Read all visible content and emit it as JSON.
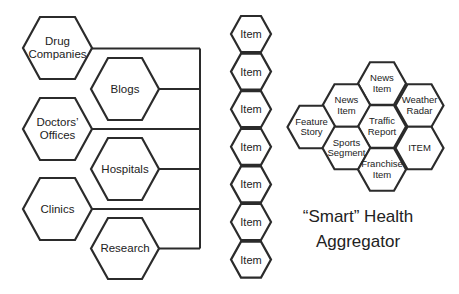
{
  "diagram": {
    "title": {
      "line1": "“Smart” Health",
      "line2": "Aggregator"
    },
    "sources": [
      {
        "label": "Drug Companies",
        "line1": "Drug",
        "line2": "Companies"
      },
      {
        "label": "Blogs",
        "line1": "Blogs",
        "line2": ""
      },
      {
        "label": "Doctors’ Offices",
        "line1": "Doctors’",
        "line2": "Offices"
      },
      {
        "label": "Hospitals",
        "line1": "Hospitals",
        "line2": ""
      },
      {
        "label": "Clinics",
        "line1": "Clinics",
        "line2": ""
      },
      {
        "label": "Research",
        "line1": "Research",
        "line2": ""
      }
    ],
    "items": [
      "Item",
      "Item",
      "Item",
      "Item",
      "Item",
      "Item",
      "Item"
    ],
    "aggregator_cells": [
      {
        "line1": "News",
        "line2": "Item"
      },
      {
        "line1": "News",
        "line2": "Item"
      },
      {
        "line1": "Weather",
        "line2": "Radar"
      },
      {
        "line1": "Feature",
        "line2": "Story"
      },
      {
        "line1": "Traffic",
        "line2": "Report"
      },
      {
        "line1": "Sports",
        "line2": "Segment"
      },
      {
        "line1": "ITEM",
        "line2": ""
      },
      {
        "line1": "Franchise",
        "line2": "Item"
      }
    ],
    "colors": {
      "stroke": "#2b2b2b",
      "text": "#222222",
      "background": "#ffffff"
    }
  }
}
